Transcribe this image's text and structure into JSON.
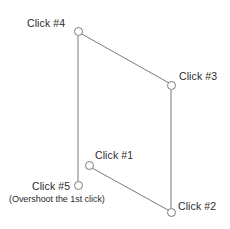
{
  "diagram": {
    "background_color": "#ffffff",
    "stroke_color": "#7a7a7a",
    "text_color": "#2b2b2b",
    "width": 230,
    "height": 229,
    "nodes": [
      {
        "id": "click-1",
        "label": "Click #1",
        "sublabel": "",
        "cx": 89,
        "cy": 165,
        "r": 4.5,
        "label_x": 95,
        "label_y": 149,
        "label_align": "left"
      },
      {
        "id": "click-2",
        "label": "Click #2",
        "sublabel": "",
        "cx": 171,
        "cy": 212,
        "r": 4.5,
        "label_x": 178,
        "label_y": 200,
        "label_align": "left"
      },
      {
        "id": "click-3",
        "label": "Click #3",
        "sublabel": "",
        "cx": 171,
        "cy": 85,
        "r": 4.5,
        "label_x": 179,
        "label_y": 70,
        "label_align": "left"
      },
      {
        "id": "click-4",
        "label": "Click #4",
        "sublabel": "",
        "cx": 78,
        "cy": 31,
        "r": 4.5,
        "label_x": 27,
        "label_y": 17,
        "label_align": "left"
      },
      {
        "id": "click-5",
        "label": "Click #5",
        "sublabel": "(Overshoot the 1st click)",
        "cx": 78,
        "cy": 185,
        "r": 4.5,
        "label_x": 32,
        "label_y": 180,
        "sublabel_x": 9,
        "sublabel_y": 194,
        "label_align": "left"
      }
    ],
    "edges": [
      {
        "id": "edge-4-3",
        "from": "click-4",
        "to": "click-3",
        "x1": 80,
        "y1": 33,
        "x2": 169,
        "y2": 83
      },
      {
        "id": "edge-4-5",
        "from": "click-4",
        "to": "click-5",
        "x1": 78,
        "y1": 36,
        "x2": 78,
        "y2": 181
      },
      {
        "id": "edge-1-2",
        "from": "click-1",
        "to": "click-2",
        "x1": 92,
        "y1": 168,
        "x2": 168,
        "y2": 210
      },
      {
        "id": "edge-3-2",
        "from": "click-3",
        "to": "click-2",
        "x1": 171,
        "y1": 90,
        "x2": 171,
        "y2": 208
      }
    ]
  }
}
